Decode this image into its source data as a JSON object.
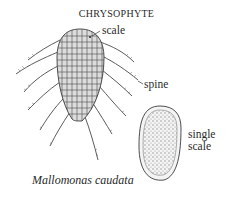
{
  "title": "CHRYSOPHYTE",
  "labels": {
    "scale": "scale",
    "spine": "spine",
    "single_scale_line1": "single",
    "single_scale_line2": "scale"
  },
  "caption": "Mallomonas caudata",
  "colors": {
    "ink": "#3a3a3a",
    "body_fill": "#d9d9d9",
    "scale_fill": "#d0d0d0",
    "dot": "#8a8a8a"
  }
}
